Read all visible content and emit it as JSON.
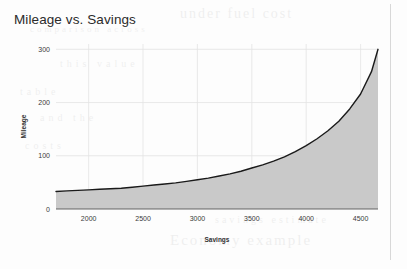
{
  "chart_data": {
    "type": "area",
    "title": "Mileage vs. Savings",
    "xlabel": "Savings",
    "ylabel": "Mileage",
    "xlim": [
      1700,
      4660
    ],
    "ylim": [
      0,
      310
    ],
    "xticks": [
      2000,
      2500,
      3000,
      3500,
      4000,
      4500
    ],
    "yticks": [
      0,
      100,
      200,
      300
    ],
    "grid": true,
    "legend": null,
    "series": [
      {
        "name": "Mileage",
        "line_color": "#1a1a1a",
        "fill_color": "#c9c9c9",
        "x": [
          1700,
          1800,
          1900,
          2000,
          2100,
          2200,
          2300,
          2400,
          2500,
          2600,
          2700,
          2800,
          2900,
          3000,
          3100,
          3200,
          3300,
          3400,
          3500,
          3600,
          3700,
          3800,
          3900,
          4000,
          4100,
          4200,
          4300,
          4400,
          4500,
          4600,
          4660
        ],
        "y": [
          33,
          34,
          35,
          36,
          37,
          38,
          39,
          41,
          43,
          45,
          47,
          49,
          52,
          55,
          58,
          62,
          66,
          71,
          77,
          83,
          90,
          98,
          108,
          119,
          132,
          147,
          165,
          188,
          216,
          258,
          300
        ]
      }
    ]
  },
  "ghost_text": {
    "line1": "under fuel cost",
    "line2": "comparison across",
    "line3": "this value",
    "line4": "table",
    "line5": "and the",
    "line6": "costs",
    "line7": "Economy  example",
    "line8": "savings estimate"
  }
}
